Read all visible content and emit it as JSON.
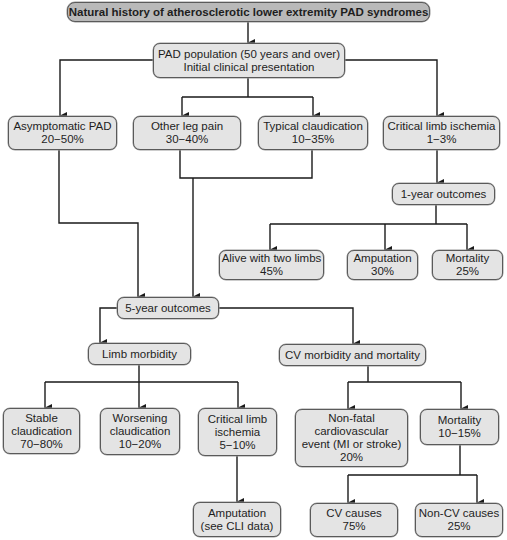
{
  "colors": {
    "title_fill": "#b9b9b9",
    "node_fill": "#e4e4e4",
    "border": "#5a5a5a",
    "line": "#1a1a1a"
  },
  "title": "Natural history of atherosclerotic lower extremity PAD syndromes",
  "population": {
    "line1": "PAD population (50 years and over)",
    "line2": "Initial clinical presentation"
  },
  "presentation": [
    {
      "label": "Asymptomatic PAD",
      "value": "20−50%"
    },
    {
      "label": "Other leg pain",
      "value": "30−40%"
    },
    {
      "label": "Typical claudication",
      "value": "10−35%"
    },
    {
      "label": "Critical limb ischemia",
      "value": "1−3%"
    }
  ],
  "one_year": {
    "label": "1-year outcomes",
    "outcomes": [
      {
        "label": "Alive with two limbs",
        "value": "45%"
      },
      {
        "label": "Amputation",
        "value": "30%"
      },
      {
        "label": "Mortality",
        "value": "25%"
      }
    ]
  },
  "five_year": {
    "label": "5-year outcomes",
    "limb": {
      "label": "Limb morbidity",
      "outcomes": [
        {
          "line1": "Stable",
          "line2": "claudication",
          "value": "70−80%"
        },
        {
          "line1": "Worsening",
          "line2": "claudication",
          "value": "10−20%"
        },
        {
          "line1": "Critical limb",
          "line2": "ischemia",
          "value": "5−10%"
        }
      ],
      "amputation": {
        "line1": "Amputation",
        "line2": "(see CLI data)"
      }
    },
    "cv": {
      "label": "CV morbidity and mortality",
      "nonfatal": {
        "line1": "Non-fatal",
        "line2": "cardiovascular",
        "line3": "event (MI or stroke)",
        "value": "20%"
      },
      "mortality": {
        "label": "Mortality",
        "value": "10−15%"
      },
      "causes": [
        {
          "label": "CV causes",
          "value": "75%"
        },
        {
          "label": "Non-CV causes",
          "value": "25%"
        }
      ]
    }
  }
}
